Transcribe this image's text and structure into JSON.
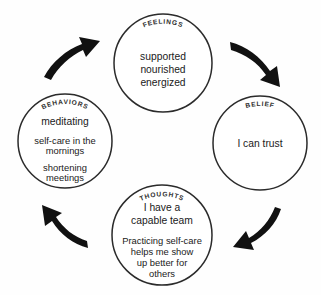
{
  "diagram": {
    "type": "cycle",
    "direction": "counterclockwise",
    "background_color": "#fefefe",
    "stroke_color": "#2b2b2b",
    "text_color": "#1a1a1a",
    "arrow_color": "#111111",
    "nodes": [
      {
        "id": "feelings",
        "label": "FEELINGS",
        "position": "top",
        "center_x": 163,
        "center_y": 63,
        "radius": 49,
        "lines": [
          "supported",
          "nourished",
          "energized"
        ]
      },
      {
        "id": "belief",
        "label": "BELIEF",
        "position": "right",
        "center_x": 260,
        "center_y": 143,
        "radius": 47,
        "lines": [
          "I can trust"
        ]
      },
      {
        "id": "thoughts",
        "label": "THOUGHTS",
        "position": "bottom",
        "center_x": 162,
        "center_y": 235,
        "radius": 50,
        "lines_block_one": [
          "I have a",
          "capable team"
        ],
        "lines_block_two": [
          "Practicing self-care",
          "helps me show",
          "up better for",
          "others"
        ]
      },
      {
        "id": "behaviors",
        "label": "BEHAVIORS",
        "position": "left",
        "center_x": 65,
        "center_y": 141,
        "radius": 47,
        "lines_block_one": [
          "meditating"
        ],
        "lines_block_two": [
          "self-care in the",
          "mornings"
        ],
        "lines_block_three": [
          "shortening",
          "meetings"
        ]
      }
    ],
    "arrows": [
      {
        "id": "arrow-behaviors-to-feelings",
        "from": "behaviors",
        "to": "feelings",
        "position": "top-left",
        "direction": "up-right"
      },
      {
        "id": "arrow-feelings-to-belief",
        "from": "feelings",
        "to": "belief",
        "position": "top-right",
        "direction": "down-right"
      },
      {
        "id": "arrow-belief-to-thoughts",
        "from": "belief",
        "to": "thoughts",
        "position": "bottom-right",
        "direction": "down-left"
      },
      {
        "id": "arrow-thoughts-to-behaviors",
        "from": "thoughts",
        "to": "behaviors",
        "position": "bottom-left",
        "direction": "up-left"
      }
    ]
  }
}
